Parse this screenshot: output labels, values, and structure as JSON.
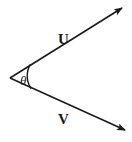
{
  "figure": {
    "background_color": "#ffffff",
    "stroke_color": "#1a1a1a"
  },
  "diagram_data": {
    "type": "vector-angle-diagram",
    "vertex": {
      "x": 10,
      "y": 78
    },
    "rays": [
      {
        "name": "U",
        "label": "U",
        "label_position": {
          "x": 58,
          "y": 44
        },
        "start": {
          "x": 10,
          "y": 78
        },
        "end": {
          "x": 124,
          "y": 7
        },
        "arrowhead": "end",
        "direction_deg": 32
      },
      {
        "name": "V",
        "label": "V",
        "label_position": {
          "x": 58,
          "y": 124
        },
        "start": {
          "x": 10,
          "y": 78
        },
        "end": {
          "x": 127,
          "y": 131
        },
        "arrowhead": "end",
        "direction_deg": -24
      }
    ],
    "angle_arc": {
      "label": "θ",
      "label_position": {
        "x": 20,
        "y": 86
      },
      "radius": 23,
      "from": {
        "x": 30,
        "y": 66
      },
      "to": {
        "x": 31,
        "y": 88
      }
    }
  },
  "labels": {
    "vector_u": "U",
    "vector_v": "V",
    "theta": "θ"
  }
}
